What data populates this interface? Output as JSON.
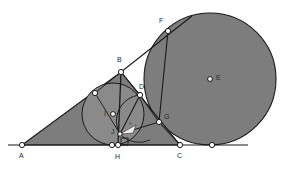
{
  "figure": {
    "background_color": "#ffffff",
    "shape_fill": "#7d7d7d",
    "stroke_color": "#1a1a1a",
    "vertex_fill": "#ffffff",
    "label_color": "#2b2b2b"
  },
  "labels": {
    "A": "A",
    "B": "B",
    "C": "C",
    "D": "D",
    "E": "E",
    "F": "F",
    "G": "G",
    "H": "H",
    "I": "I",
    "J": "J",
    "angle_mark": "a"
  },
  "points": {
    "A": {
      "x": 22,
      "y": 145
    },
    "B": {
      "x": 121,
      "y": 72
    },
    "C": {
      "x": 180,
      "y": 145
    },
    "D": {
      "x": 140,
      "y": 95
    },
    "E": {
      "x": 210,
      "y": 79
    },
    "F": {
      "x": 168,
      "y": 31
    },
    "G": {
      "x": 159,
      "y": 122
    },
    "H": {
      "x": 118,
      "y": 145
    },
    "I": {
      "x": 113,
      "y": 114
    },
    "J": {
      "x": 120,
      "y": 134
    },
    "T_ab": {
      "x": 95,
      "y": 93
    },
    "T_base": {
      "x": 212,
      "y": 145
    },
    "H2": {
      "x": 112,
      "y": 145
    },
    "line_start": {
      "x": 8,
      "y": 145
    },
    "line_end": {
      "x": 248,
      "y": 145
    },
    "tangent_top": {
      "x": 192,
      "y": 16
    }
  },
  "circles": {
    "incircle": {
      "cx": 113,
      "cy": 114,
      "r": 31,
      "name": "incircle-I"
    },
    "excircle": {
      "cx": 210,
      "cy": 79,
      "r": 66,
      "name": "circle-E"
    },
    "small_arc": {
      "cx": 142,
      "cy": 120,
      "r": 22,
      "name": "arc-D-J"
    }
  },
  "label_positions": {
    "A": {
      "x": 19,
      "y": 155
    },
    "B": {
      "x": 117,
      "y": 58
    },
    "C": {
      "x": 177,
      "y": 155
    },
    "D": {
      "x": 139,
      "y": 85
    },
    "E": {
      "x": 218,
      "y": 74
    },
    "F": {
      "x": 160,
      "y": 19
    },
    "G": {
      "x": 165,
      "y": 115
    },
    "H": {
      "x": 116,
      "y": 156
    },
    "I": {
      "x": 105,
      "y": 111
    },
    "J": {
      "x": 112,
      "y": 130
    },
    "angle_mark": {
      "x": 129,
      "y": 124
    }
  }
}
